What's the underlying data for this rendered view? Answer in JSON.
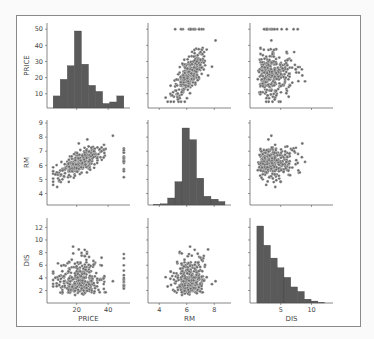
{
  "chart_data": {
    "type": "scatter",
    "title": "",
    "variables": [
      "PRICE",
      "RM",
      "DIS"
    ],
    "colors": {
      "marker": "#6b6b6b",
      "marker_edge": "#ffffff",
      "bar": "#5a5a5a",
      "axis": "#555555",
      "background": "#ffffff"
    },
    "axes": {
      "PRICE": {
        "range": [
          3,
          52
        ],
        "ticks": [
          20,
          40
        ],
        "yticks": [
          10,
          20,
          30,
          40,
          50
        ]
      },
      "RM": {
        "range": [
          3.4,
          9
        ],
        "ticks": [
          4,
          6,
          8
        ],
        "yticks": [
          4,
          5,
          6,
          7,
          8,
          9
        ]
      },
      "DIS": {
        "range": [
          0.5,
          13
        ],
        "ticks": [
          5,
          10
        ],
        "yticks": [
          2,
          4,
          6,
          8,
          10,
          12
        ]
      }
    },
    "histograms": {
      "PRICE": {
        "bin_edges": [
          5,
          9.5,
          14,
          18.5,
          23,
          27.5,
          32,
          36.5,
          41,
          45.5,
          50
        ],
        "counts": [
          8,
          19,
          28,
          51,
          29,
          15,
          11,
          3,
          4,
          8
        ]
      },
      "RM": {
        "bin_edges": [
          3.56,
          4.09,
          4.61,
          5.14,
          5.66,
          6.19,
          6.71,
          7.24,
          7.76,
          8.29,
          8.78
        ],
        "counts": [
          1,
          2,
          12,
          40,
          132,
          112,
          46,
          15,
          10,
          6
        ]
      },
      "DIS": {
        "bin_edges": [
          1.13,
          2.23,
          3.33,
          4.43,
          5.53,
          6.63,
          7.73,
          8.83,
          9.93,
          11.03,
          12.13
        ],
        "counts": [
          120,
          90,
          70,
          55,
          40,
          25,
          18,
          6,
          3,
          1
        ]
      }
    },
    "panels": [
      {
        "row": "PRICE",
        "col": "PRICE",
        "kind": "hist"
      },
      {
        "row": "PRICE",
        "col": "RM",
        "kind": "scatter",
        "trend": "strong positive"
      },
      {
        "row": "PRICE",
        "col": "DIS",
        "kind": "scatter",
        "trend": "weak positive"
      },
      {
        "row": "RM",
        "col": "PRICE",
        "kind": "scatter",
        "trend": "strong positive"
      },
      {
        "row": "RM",
        "col": "RM",
        "kind": "hist"
      },
      {
        "row": "RM",
        "col": "DIS",
        "kind": "scatter",
        "trend": "weak"
      },
      {
        "row": "DIS",
        "col": "PRICE",
        "kind": "scatter",
        "trend": "weak positive"
      },
      {
        "row": "DIS",
        "col": "RM",
        "kind": "scatter",
        "trend": "none"
      },
      {
        "row": "DIS",
        "col": "DIS",
        "kind": "hist"
      }
    ],
    "grid": false,
    "legend": null
  },
  "labels": {
    "rows": [
      "PRICE",
      "RM",
      "DIS"
    ],
    "cols": [
      "PRICE",
      "RM",
      "DIS"
    ]
  }
}
